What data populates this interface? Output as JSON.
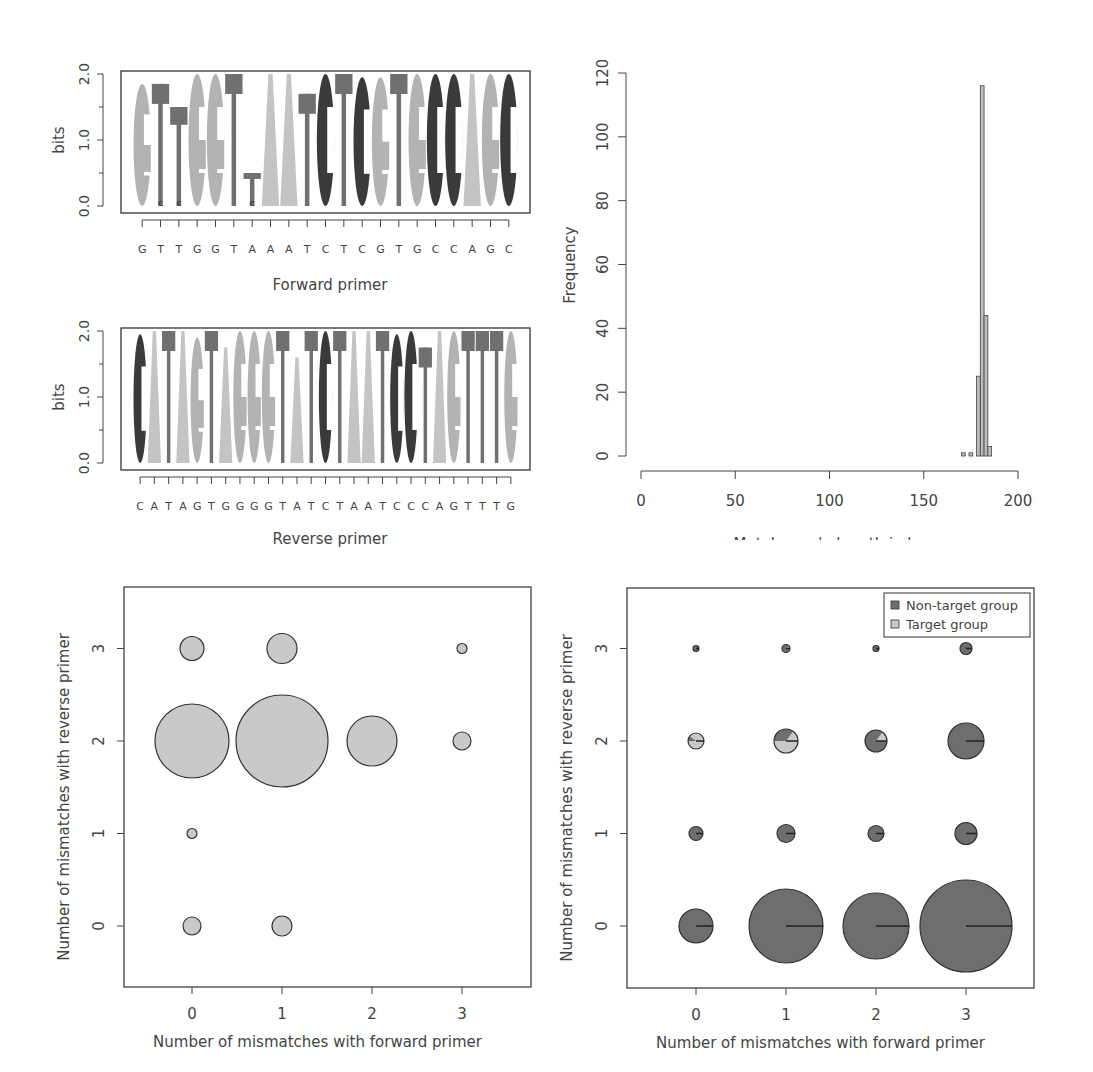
{
  "colors": {
    "A": "#c4c4c4",
    "G": "#b3b3b3",
    "T": "#707070",
    "C": "#3a3a3a",
    "target": "#c9c9c9",
    "nontarget": "#6e6e6e",
    "bar": "#bdbdbd"
  },
  "chart_data": [
    {
      "type": "sequence-logo",
      "title": "",
      "xlabel": "Forward primer",
      "ylabel": "bits",
      "ylim": [
        0,
        2
      ],
      "yticks": [
        "0.0",
        "1.0",
        "2.0"
      ],
      "sequence": "GTTGGTAAATCTCGTGCCAGC",
      "positions": [
        {
          "letter": "G",
          "height": 1.85
        },
        {
          "letter": "T",
          "height": 1.85,
          "minor": "C"
        },
        {
          "letter": "T",
          "height": 1.5,
          "minor": "C"
        },
        {
          "letter": "G",
          "height": 2.0
        },
        {
          "letter": "G",
          "height": 2.0
        },
        {
          "letter": "T",
          "height": 2.0
        },
        {
          "letter": "T",
          "height": 0.5,
          "minor": "C",
          "lower": "A"
        },
        {
          "letter": "A",
          "height": 2.0
        },
        {
          "letter": "A",
          "height": 2.0
        },
        {
          "letter": "T",
          "height": 1.7
        },
        {
          "letter": "C",
          "height": 2.0
        },
        {
          "letter": "T",
          "height": 2.0
        },
        {
          "letter": "C",
          "height": 1.95
        },
        {
          "letter": "G",
          "height": 1.95
        },
        {
          "letter": "T",
          "height": 2.0
        },
        {
          "letter": "G",
          "height": 2.0
        },
        {
          "letter": "C",
          "height": 2.0
        },
        {
          "letter": "C",
          "height": 2.0
        },
        {
          "letter": "A",
          "height": 2.0
        },
        {
          "letter": "G",
          "height": 2.0
        },
        {
          "letter": "C",
          "height": 2.0
        }
      ]
    },
    {
      "type": "sequence-logo",
      "xlabel": "Reverse primer",
      "ylabel": "bits",
      "ylim": [
        0,
        2
      ],
      "yticks": [
        "0.0",
        "1.0",
        "2.0"
      ],
      "sequence": "CATAGTGGGGTATCTAATCCCAGTTTG",
      "positions": [
        {
          "letter": "C",
          "height": 1.95
        },
        {
          "letter": "A",
          "height": 2.0
        },
        {
          "letter": "T",
          "height": 2.0
        },
        {
          "letter": "A",
          "height": 2.0
        },
        {
          "letter": "G",
          "height": 1.9
        },
        {
          "letter": "T",
          "height": 2.0
        },
        {
          "letter": "A",
          "height": 1.75
        },
        {
          "letter": "G",
          "height": 2.0
        },
        {
          "letter": "G",
          "height": 2.0
        },
        {
          "letter": "G",
          "height": 2.0
        },
        {
          "letter": "T",
          "height": 2.0
        },
        {
          "letter": "A",
          "height": 1.6
        },
        {
          "letter": "T",
          "height": 2.0
        },
        {
          "letter": "C",
          "height": 2.0
        },
        {
          "letter": "T",
          "height": 2.0
        },
        {
          "letter": "A",
          "height": 2.0
        },
        {
          "letter": "A",
          "height": 2.0
        },
        {
          "letter": "T",
          "height": 2.0
        },
        {
          "letter": "C",
          "height": 1.95
        },
        {
          "letter": "C",
          "height": 2.0
        },
        {
          "letter": "T",
          "height": 1.75
        },
        {
          "letter": "A",
          "height": 2.0
        },
        {
          "letter": "G",
          "height": 2.0
        },
        {
          "letter": "T",
          "height": 2.0
        },
        {
          "letter": "T",
          "height": 2.0
        },
        {
          "letter": "T",
          "height": 2.0
        },
        {
          "letter": "G",
          "height": 2.0
        }
      ]
    },
    {
      "type": "bar",
      "subtype": "histogram",
      "xlabel": "Metabarcode length in bp",
      "ylabel": "Frequency",
      "xlim": [
        0,
        200
      ],
      "ylim": [
        0,
        120
      ],
      "xticks": [
        "0",
        "50",
        "100",
        "150",
        "200"
      ],
      "yticks": [
        "0",
        "20",
        "40",
        "60",
        "80",
        "100",
        "120"
      ],
      "bins": [
        {
          "from": 170,
          "to": 172,
          "count": 1
        },
        {
          "from": 172,
          "to": 174,
          "count": 0
        },
        {
          "from": 174,
          "to": 176,
          "count": 1
        },
        {
          "from": 176,
          "to": 178,
          "count": 0
        },
        {
          "from": 178,
          "to": 180,
          "count": 25
        },
        {
          "from": 180,
          "to": 182,
          "count": 116
        },
        {
          "from": 182,
          "to": 184,
          "count": 44
        },
        {
          "from": 184,
          "to": 186,
          "count": 3
        }
      ]
    },
    {
      "type": "scatter",
      "subtype": "bubble",
      "xlabel": "Number of mismatches with forward primer",
      "ylabel": "Number of mismatches with reverse primer",
      "xticks": [
        "0",
        "1",
        "2",
        "3"
      ],
      "yticks": [
        "0",
        "1",
        "2",
        "3"
      ],
      "points": [
        {
          "x": 0,
          "y": 3,
          "r": 12
        },
        {
          "x": 1,
          "y": 3,
          "r": 15
        },
        {
          "x": 3,
          "y": 3,
          "r": 5
        },
        {
          "x": 0,
          "y": 2,
          "r": 37
        },
        {
          "x": 1,
          "y": 2,
          "r": 46
        },
        {
          "x": 2,
          "y": 2,
          "r": 25
        },
        {
          "x": 3,
          "y": 2,
          "r": 9
        },
        {
          "x": 0,
          "y": 1,
          "r": 5
        },
        {
          "x": 0,
          "y": 0,
          "r": 9
        },
        {
          "x": 1,
          "y": 0,
          "r": 10
        }
      ]
    },
    {
      "type": "pie-scatter",
      "xlabel": "Number of mismatches with forward primer",
      "ylabel": "Number of mismatches with reverse primer",
      "xticks": [
        "0",
        "1",
        "2",
        "3"
      ],
      "yticks": [
        "0",
        "1",
        "2",
        "3"
      ],
      "legend": [
        {
          "label": "Non-target group",
          "color": "#6e6e6e"
        },
        {
          "label": "Target group",
          "color": "#c9c9c9"
        }
      ],
      "legend_position": "top-right",
      "points": [
        {
          "x": 0,
          "y": 3,
          "r": 3,
          "target_frac": 0
        },
        {
          "x": 1,
          "y": 3,
          "r": 4,
          "target_frac": 0.1
        },
        {
          "x": 2,
          "y": 3,
          "r": 3,
          "target_frac": 0
        },
        {
          "x": 3,
          "y": 3,
          "r": 6,
          "target_frac": 0
        },
        {
          "x": 0,
          "y": 2,
          "r": 8,
          "target_frac": 0.9
        },
        {
          "x": 1,
          "y": 2,
          "r": 12,
          "target_frac": 0.65
        },
        {
          "x": 2,
          "y": 2,
          "r": 11,
          "target_frac": 0.15
        },
        {
          "x": 3,
          "y": 2,
          "r": 18,
          "target_frac": 0
        },
        {
          "x": 0,
          "y": 1,
          "r": 7,
          "target_frac": 0
        },
        {
          "x": 1,
          "y": 1,
          "r": 9,
          "target_frac": 0
        },
        {
          "x": 2,
          "y": 1,
          "r": 8,
          "target_frac": 0
        },
        {
          "x": 3,
          "y": 1,
          "r": 11,
          "target_frac": 0
        },
        {
          "x": 0,
          "y": 0,
          "r": 17,
          "target_frac": 0
        },
        {
          "x": 1,
          "y": 0,
          "r": 37,
          "target_frac": 0
        },
        {
          "x": 2,
          "y": 0,
          "r": 33,
          "target_frac": 0
        },
        {
          "x": 3,
          "y": 0,
          "r": 46,
          "target_frac": 0
        }
      ]
    }
  ]
}
